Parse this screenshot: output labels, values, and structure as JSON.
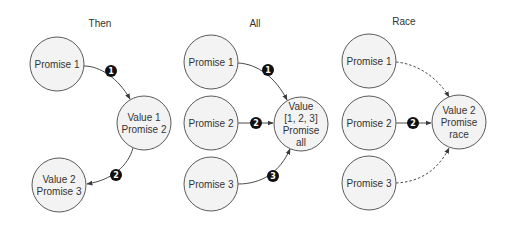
{
  "diagram_title": "Promise composition: then, all, race",
  "colors": {
    "node_fill": "#f3f3f3",
    "node_stroke": "#5a5a5a",
    "edge": "#4a4a4a",
    "badge_fill": "#111111",
    "badge_text": "#ffffff",
    "text": "#333333"
  },
  "panels": [
    {
      "id": "then",
      "title": "Then",
      "nodes": [
        {
          "id": "p1",
          "lines": [
            "Promise 1"
          ]
        },
        {
          "id": "v1",
          "lines": [
            "Value 1",
            "Promise 2"
          ]
        },
        {
          "id": "v2",
          "lines": [
            "Value 2",
            "Promise 3"
          ]
        }
      ],
      "edges": [
        {
          "from": "p1",
          "to": "v1",
          "style": "solid",
          "badge": "1"
        },
        {
          "from": "v1",
          "to": "v2",
          "style": "solid",
          "badge": "2"
        }
      ]
    },
    {
      "id": "all",
      "title": "All",
      "nodes": [
        {
          "id": "p1",
          "lines": [
            "Promise 1"
          ]
        },
        {
          "id": "p2",
          "lines": [
            "Promise 2"
          ]
        },
        {
          "id": "p3",
          "lines": [
            "Promise 3"
          ]
        },
        {
          "id": "result",
          "lines": [
            "Value",
            "[1, 2, 3]",
            "Promise",
            "all"
          ]
        }
      ],
      "edges": [
        {
          "from": "p1",
          "to": "result",
          "style": "solid",
          "badge": "1"
        },
        {
          "from": "p2",
          "to": "result",
          "style": "solid",
          "badge": "2"
        },
        {
          "from": "p3",
          "to": "result",
          "style": "solid",
          "badge": "3"
        }
      ]
    },
    {
      "id": "race",
      "title": "Race",
      "nodes": [
        {
          "id": "p1",
          "lines": [
            "Promise 1"
          ]
        },
        {
          "id": "p2",
          "lines": [
            "Promise 2"
          ]
        },
        {
          "id": "p3",
          "lines": [
            "Promise 3"
          ]
        },
        {
          "id": "result",
          "lines": [
            "Value 2",
            "Promise",
            "race"
          ]
        }
      ],
      "edges": [
        {
          "from": "p1",
          "to": "result",
          "style": "dashed",
          "badge": ""
        },
        {
          "from": "p2",
          "to": "result",
          "style": "solid",
          "badge": "2"
        },
        {
          "from": "p3",
          "to": "result",
          "style": "dashed",
          "badge": ""
        }
      ]
    }
  ]
}
